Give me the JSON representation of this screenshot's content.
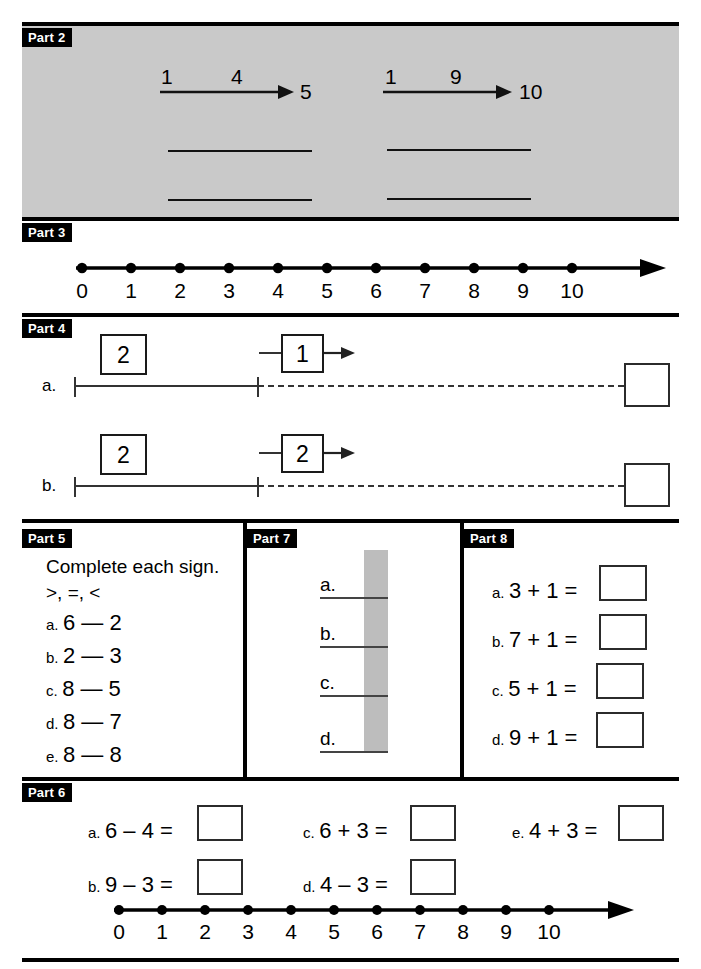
{
  "page": {
    "width": 701,
    "height": 969,
    "background": "#ffffff",
    "ink": "#000000",
    "shade_gray": "#c9c9c9"
  },
  "parts": {
    "p2": {
      "tag": "Part 2"
    },
    "p3": {
      "tag": "Part 3"
    },
    "p4": {
      "tag": "Part 4"
    },
    "p5": {
      "tag": "Part 5"
    },
    "p6": {
      "tag": "Part 6"
    },
    "p7": {
      "tag": "Part 7"
    },
    "p8": {
      "tag": "Part 8"
    }
  },
  "part2": {
    "arrows": [
      {
        "start": "1",
        "above": "4",
        "end": "5"
      },
      {
        "start": "1",
        "above": "9",
        "end": "10"
      }
    ],
    "blank_lines_rows": 2,
    "blank_lines_cols": 2
  },
  "part3": {
    "numberline": {
      "labels": [
        "0",
        "1",
        "2",
        "3",
        "4",
        "5",
        "6",
        "7",
        "8",
        "9",
        "10"
      ],
      "has_arrowhead": true
    }
  },
  "part4": {
    "rows": [
      {
        "label": "a.",
        "start_box": "2",
        "operator_box": "1",
        "answer_box": ""
      },
      {
        "label": "b.",
        "start_box": "2",
        "operator_box": "2",
        "answer_box": ""
      }
    ]
  },
  "part5": {
    "instruction_line1": "Complete each sign.",
    "instruction_line2": ">, =, <",
    "items": [
      {
        "idx": "a.",
        "expr": "6 — 2"
      },
      {
        "idx": "b.",
        "expr": "2 — 3"
      },
      {
        "idx": "c.",
        "expr": "8 — 5"
      },
      {
        "idx": "d.",
        "expr": "8 — 7"
      },
      {
        "idx": "e.",
        "expr": "8 — 8"
      }
    ]
  },
  "part6": {
    "items": [
      {
        "idx": "a.",
        "expr": "6 – 4 =",
        "answer": ""
      },
      {
        "idx": "b.",
        "expr": "9 – 3 =",
        "answer": ""
      },
      {
        "idx": "c.",
        "expr": "6 + 3 =",
        "answer": ""
      },
      {
        "idx": "d.",
        "expr": "4 – 3 =",
        "answer": ""
      },
      {
        "idx": "e.",
        "expr": "4 + 3 =",
        "answer": ""
      }
    ],
    "numberline": {
      "labels": [
        "0",
        "1",
        "2",
        "3",
        "4",
        "5",
        "6",
        "7",
        "8",
        "9",
        "10"
      ],
      "has_arrowhead": true
    }
  },
  "part7": {
    "bar_color": "#bdbdbd",
    "leaders": [
      {
        "idx": "a."
      },
      {
        "idx": "b."
      },
      {
        "idx": "c."
      },
      {
        "idx": "d."
      }
    ]
  },
  "part8": {
    "items": [
      {
        "idx": "a.",
        "expr": "3 + 1 =",
        "answer": ""
      },
      {
        "idx": "b.",
        "expr": "7 + 1 =",
        "answer": ""
      },
      {
        "idx": "c.",
        "expr": "5 + 1 =",
        "answer": ""
      },
      {
        "idx": "d.",
        "expr": "9 + 1 =",
        "answer": ""
      }
    ]
  }
}
